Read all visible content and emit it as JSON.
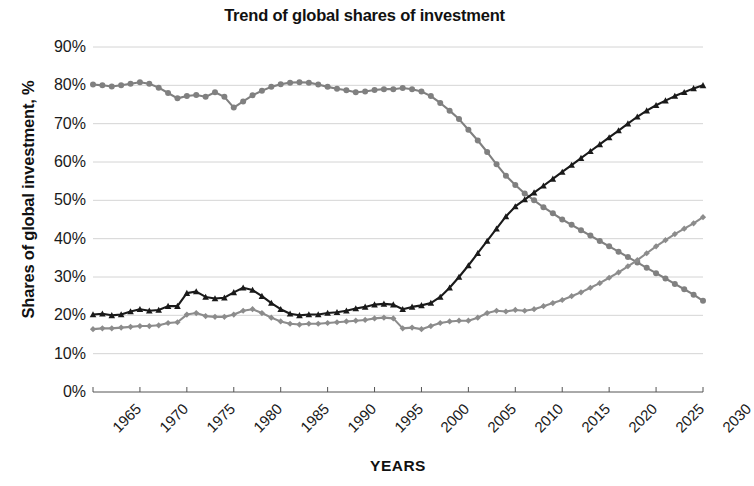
{
  "chart_data": {
    "type": "line",
    "title": "Trend of global shares of investment",
    "xlabel": "YEARS",
    "ylabel": "Shares of global investment, %",
    "xlim": [
      1965,
      2030
    ],
    "ylim": [
      0,
      90
    ],
    "grid": true,
    "legend": "none",
    "xticks": [
      "1965",
      "1970",
      "1975",
      "1980",
      "1985",
      "1990",
      "1995",
      "2000",
      "2005",
      "2010",
      "2015",
      "2020",
      "2025",
      "2030"
    ],
    "yticks": [
      "0%",
      "10%",
      "20%",
      "30%",
      "40%",
      "50%",
      "60%",
      "70%",
      "80%",
      "90%"
    ],
    "x": [
      1965,
      1966,
      1967,
      1968,
      1969,
      1970,
      1971,
      1972,
      1973,
      1974,
      1975,
      1976,
      1977,
      1978,
      1979,
      1980,
      1981,
      1982,
      1983,
      1984,
      1985,
      1986,
      1987,
      1988,
      1989,
      1990,
      1991,
      1992,
      1993,
      1994,
      1995,
      1996,
      1997,
      1998,
      1999,
      2000,
      2001,
      2002,
      2003,
      2004,
      2005,
      2006,
      2007,
      2008,
      2009,
      2010,
      2011,
      2012,
      2013,
      2014,
      2015,
      2016,
      2017,
      2018,
      2019,
      2020,
      2021,
      2022,
      2023,
      2024,
      2025,
      2026,
      2027,
      2028,
      2029,
      2030
    ],
    "series": [
      {
        "name": "advanced-economies-share",
        "color": "#808080",
        "marker": "circle",
        "values": [
          80.2,
          80.0,
          79.7,
          80.0,
          80.4,
          80.8,
          80.4,
          79.4,
          78.0,
          76.6,
          77.2,
          77.5,
          77.0,
          78.2,
          77.0,
          74.2,
          75.8,
          77.4,
          78.6,
          79.6,
          80.3,
          80.7,
          80.8,
          80.7,
          80.2,
          79.6,
          79.1,
          78.7,
          78.2,
          78.4,
          78.8,
          79.0,
          79.0,
          79.3,
          79.0,
          78.4,
          77.2,
          75.4,
          73.4,
          71.2,
          68.4,
          65.6,
          62.6,
          59.4,
          56.4,
          54.0,
          51.8,
          50.0,
          48.2,
          46.6,
          45.0,
          43.6,
          42.2,
          40.8,
          39.4,
          38.0,
          36.6,
          35.2,
          33.8,
          32.4,
          31.0,
          29.6,
          28.2,
          26.8,
          25.4,
          23.8
        ]
      },
      {
        "name": "emerging-economies-share",
        "color": "#1a1a1a",
        "marker": "triangle",
        "values": [
          20.2,
          20.4,
          20.0,
          20.2,
          21.0,
          21.6,
          21.2,
          21.4,
          22.4,
          22.4,
          25.8,
          26.2,
          24.8,
          24.4,
          24.6,
          26.0,
          27.2,
          26.6,
          25.0,
          23.2,
          21.6,
          20.4,
          20.0,
          20.2,
          20.2,
          20.6,
          20.8,
          21.2,
          21.8,
          22.2,
          22.8,
          23.0,
          22.8,
          21.6,
          22.2,
          22.6,
          23.2,
          24.8,
          27.2,
          30.0,
          33.0,
          36.2,
          39.4,
          42.6,
          45.8,
          48.4,
          50.2,
          52.0,
          53.8,
          55.6,
          57.4,
          59.2,
          61.0,
          62.8,
          64.6,
          66.4,
          68.2,
          70.0,
          71.8,
          73.4,
          74.8,
          76.0,
          77.2,
          78.2,
          79.2,
          80.0
        ]
      },
      {
        "name": "secondary-share",
        "color": "#8c8c8c",
        "marker": "diamond",
        "values": [
          16.4,
          16.6,
          16.6,
          16.8,
          17.0,
          17.2,
          17.2,
          17.4,
          18.0,
          18.2,
          20.2,
          20.6,
          19.8,
          19.6,
          19.6,
          20.2,
          21.2,
          21.6,
          20.6,
          19.4,
          18.4,
          17.8,
          17.6,
          17.8,
          17.8,
          18.0,
          18.2,
          18.4,
          18.6,
          18.8,
          19.2,
          19.4,
          19.2,
          16.6,
          16.8,
          16.4,
          17.2,
          18.0,
          18.4,
          18.6,
          18.6,
          19.4,
          20.6,
          21.2,
          21.0,
          21.4,
          21.2,
          21.6,
          22.4,
          23.2,
          24.0,
          25.0,
          26.0,
          27.2,
          28.4,
          29.8,
          31.2,
          32.8,
          34.4,
          36.2,
          38.0,
          39.6,
          41.2,
          42.6,
          44.0,
          45.6
        ]
      }
    ]
  }
}
